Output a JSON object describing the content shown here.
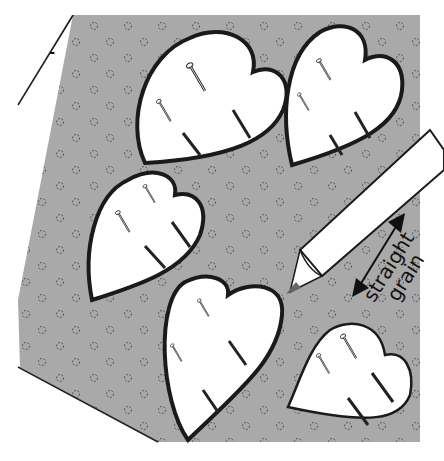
{
  "figure": {
    "step_number": "1",
    "heading_fragment": "g",
    "grain_label_line1": "straight",
    "grain_label_line2": "grain",
    "pieces": 5,
    "colors": {
      "fabric": "#a9a9a9",
      "fabric_edge": "#222222",
      "pattern_piece": "#ffffff",
      "outline": "#1a1a1a"
    }
  }
}
